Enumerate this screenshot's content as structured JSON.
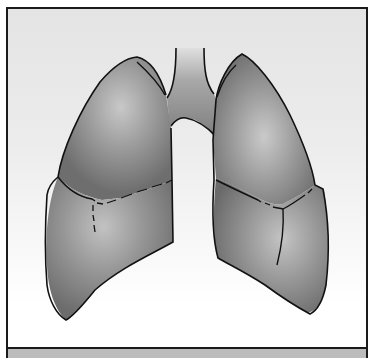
{
  "image": {
    "subject": "lungs-illustration",
    "description": "Grayscale illustration of human lungs with trachea and bronchi, lobes separated by fissure lines, inside a bordered frame",
    "parts": [
      "trachea",
      "left-lung",
      "right-lung",
      "fissure-lines"
    ]
  },
  "colors": {
    "frame_border": "#1a1a1a",
    "background_top": "#e4e4e4",
    "background_bottom": "#ffffff",
    "lung_fill_dark": "#7a7a7a",
    "lung_fill_light": "#c4c4c4",
    "outline": "#111111",
    "bottom_band": "#bcbcbc"
  }
}
